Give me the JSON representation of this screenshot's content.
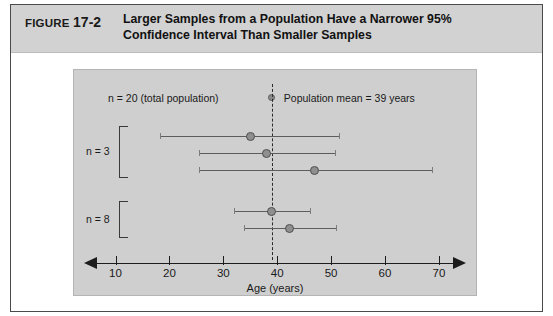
{
  "figure": {
    "label": "FIGURE",
    "number": "17-2",
    "title_line1": "Larger Samples from a Population Have a Narrower 95%",
    "title_line2": "Confidence Interval Than Smaller Samples",
    "caption_bg": "#d2d2d2",
    "panel_bg": "#cfcfcf"
  },
  "chart_data": {
    "type": "scatter",
    "title": "Larger Samples from a Population Have a Narrower 95% Confidence Interval Than Smaller Samples",
    "xlabel": "Age (years)",
    "ylabel": "",
    "xlim": [
      6,
      74
    ],
    "xticks": [
      10,
      20,
      30,
      40,
      50,
      60,
      70
    ],
    "xticklabels": [
      "10",
      "20",
      "30",
      "40",
      "50",
      "60",
      "70"
    ],
    "grid": false,
    "population_note": "n = 20 (total population)",
    "legend": {
      "position": "top-center",
      "entries": [
        {
          "marker": "filled-circle",
          "label": "Population mean = 39 years",
          "value": 39
        }
      ]
    },
    "annotations": [
      {
        "type": "vline",
        "x": 39,
        "style": "dashed",
        "label": "Population mean = 39 years"
      }
    ],
    "groups": [
      {
        "name": "n = 3",
        "label": "n = 3",
        "sample_size": 3,
        "intervals": [
          {
            "mean": 35.0,
            "lower": 18.2,
            "upper": 51.4
          },
          {
            "mean": 38.0,
            "lower": 25.5,
            "upper": 50.8
          },
          {
            "mean": 47.0,
            "lower": 25.5,
            "upper": 68.7
          }
        ]
      },
      {
        "name": "n = 8",
        "label": "n = 8",
        "sample_size": 8,
        "intervals": [
          {
            "mean": 39.0,
            "lower": 32.0,
            "upper": 46.0
          },
          {
            "mean": 42.2,
            "lower": 33.8,
            "upper": 51.0
          }
        ]
      }
    ],
    "colors": {
      "axis": "#1c1c1c",
      "interval": "#5d5d5d",
      "marker": "#8f8f8f",
      "marker_edge": "#4f4f4f",
      "mean_line": "#2a2a2a",
      "panel": "#cfcfcf"
    }
  }
}
